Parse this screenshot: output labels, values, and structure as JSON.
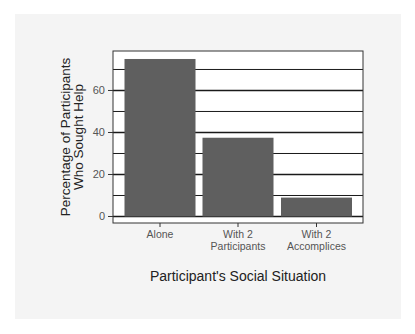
{
  "colors": {
    "page_bg": "#ffffff",
    "panel_bg": "#f4f4f4",
    "plot_bg": "#ffffff",
    "bar": "#5f5f5f",
    "grid": "#1a1a1a",
    "axis_text": "#555555",
    "title_text": "#222222"
  },
  "chart_data": {
    "type": "bar",
    "title": "",
    "xlabel": "Participant's Social Situation",
    "ylabel": [
      "Percentage of Participants",
      "Who Sought Help"
    ],
    "categories": [
      [
        "Alone"
      ],
      [
        "With 2",
        "Participants"
      ],
      [
        "With 2",
        "Accomplices"
      ]
    ],
    "values": [
      75,
      37.5,
      9
    ],
    "yticks": [
      0,
      20,
      40,
      60
    ],
    "minor_gridlines": [
      10,
      30,
      50,
      70
    ],
    "ylim": [
      -3.1,
      78.8
    ],
    "grid": true,
    "legend": null
  }
}
